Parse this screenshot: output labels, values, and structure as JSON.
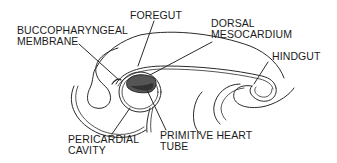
{
  "diagram": {
    "colors": {
      "line": "#2a2a2a",
      "heart_fill": "#555555",
      "heart_dark": "#3a3a3a",
      "background": "#ffffff"
    },
    "labels": {
      "buccopharyngeal": {
        "line1": "BUCCOPHARYNGEAL",
        "line2": "MEMBRANE"
      },
      "foregut": {
        "line1": "FOREGUT"
      },
      "dorsal_mesocardium": {
        "line1": "DORSAL",
        "line2": "MESOCARDIUM"
      },
      "hindgut": {
        "line1": "HINDGUT"
      },
      "pericardial_cavity": {
        "line1": "PERICARDIAL",
        "line2": "CAVITY"
      },
      "primitive_heart_tube": {
        "line1": "PRIMITIVE HEART",
        "line2": "TUBE"
      }
    }
  }
}
